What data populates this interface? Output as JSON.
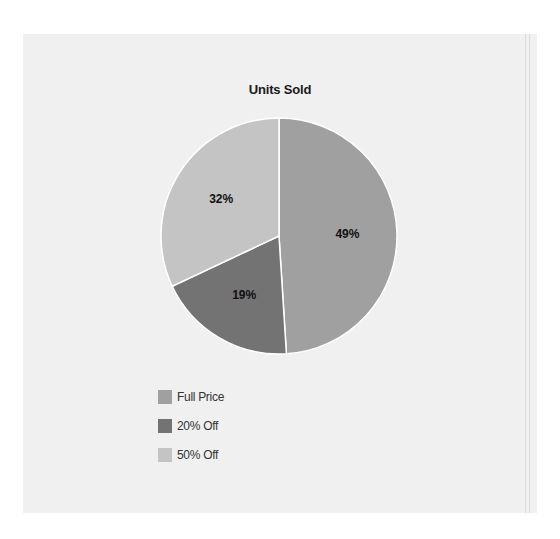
{
  "chart_data": {
    "type": "pie",
    "title": "Units Sold",
    "categories": [
      "Full Price",
      "20% Off",
      "50% Off"
    ],
    "values": [
      49,
      19,
      32
    ],
    "labels": [
      "49%",
      "19%",
      "32%"
    ],
    "colors": [
      "#a0a0a0",
      "#737373",
      "#c4c4c4"
    ],
    "start_angle_deg": 0,
    "direction": "clockwise",
    "legend_position": "bottom-left"
  },
  "legend": {
    "items": [
      {
        "label": "Full Price",
        "color": "#a0a0a0"
      },
      {
        "label": "20% Off",
        "color": "#737373"
      },
      {
        "label": "50% Off",
        "color": "#c4c4c4"
      }
    ]
  }
}
